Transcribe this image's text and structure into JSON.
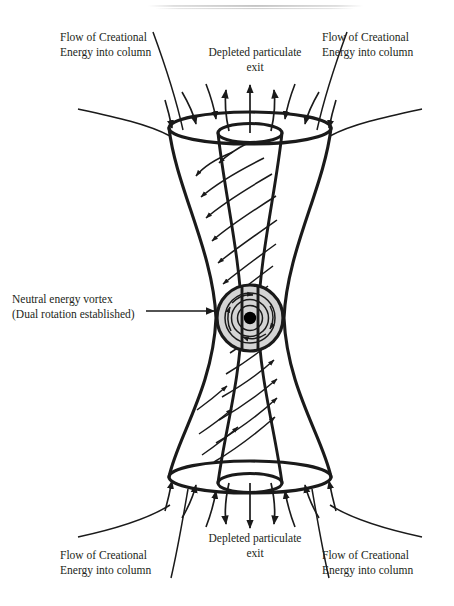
{
  "figure": {
    "title_artifact": "scan-line",
    "labels": {
      "flow_top_left": {
        "line1": "Flow of Creational",
        "line2": "Energy into column"
      },
      "flow_top_right": {
        "line1": "Flow of Creational",
        "line2": "Energy into column"
      },
      "exit_top": {
        "line1": "Depleted particulate",
        "line2": "exit"
      },
      "vortex": {
        "line1": "Neutral energy vortex",
        "line2": "(Dual rotation established)"
      },
      "flow_bottom_left": {
        "line1": "Flow of Creational",
        "line2": "Energy into column"
      },
      "flow_bottom_right": {
        "line1": "Flow of Creational",
        "line2": "Energy into column"
      },
      "exit_bottom": {
        "line1": "Depleted particulate",
        "line2": "exit"
      }
    },
    "colors": {
      "ink": "#1a1a1a",
      "text": "#231f20",
      "vortex_fill": "#d4d4d4",
      "vortex_ring": "#1a1a1a",
      "vortex_core": "#000000",
      "background": "#ffffff",
      "scan_artifact": "#c9c9c9"
    },
    "geometry": {
      "outer_top_ellipse": {
        "cx": 250,
        "cy": 128,
        "rx": 81,
        "ry": 16
      },
      "inner_top_ellipse": {
        "cx": 250,
        "cy": 133,
        "rx": 32,
        "ry": 9
      },
      "outer_bottom_ellipse": {
        "cx": 250,
        "cy": 477,
        "rx": 81,
        "ry": 16
      },
      "inner_bottom_ellipse": {
        "cx": 250,
        "cy": 483,
        "rx": 32,
        "ry": 9
      },
      "waist_y": 318,
      "waist_outer_half_width": 34,
      "waist_inner_half_width": 8,
      "vortex": {
        "cx": 250,
        "cy": 318,
        "r": 33,
        "rings": 4,
        "core_r": 6
      },
      "pointer_arrow": {
        "x1": 146,
        "y1": 311,
        "x2": 216,
        "y2": 311
      }
    },
    "element_counts": {
      "exit_arrows_top": 3,
      "exit_arrows_bottom": 3,
      "rim_inflow_arrows_top": 6,
      "rim_inflow_arrows_bottom": 6,
      "long_flow_lines_top": 4,
      "long_flow_lines_bottom": 4,
      "spiral_arrows_upper": 9,
      "spiral_arrows_lower": 9,
      "vortex_rotation_arrows": 4
    }
  }
}
